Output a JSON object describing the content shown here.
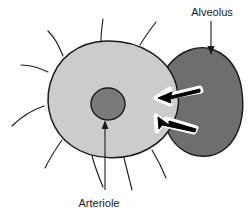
{
  "figure": {
    "type": "anatomical-diagram",
    "background_color": "#ffffff",
    "width": 249,
    "height": 219
  },
  "labels": {
    "alveolus": "Alveolus",
    "arteriole": "Arteriole"
  },
  "colors": {
    "arteriole_fill": "#cccccc",
    "lumen_fill": "#7a7a7a",
    "alveolus_fill": "#6e6e6e",
    "outline": "#1a1a1a",
    "arrow_fill": "#000000",
    "arrow_halo": "#ffffff",
    "text": "#1a1a1a"
  },
  "structures": [
    {
      "name": "arteriole-wall",
      "description": "Large light-gray oval representing the arteriole cross-section",
      "fill": "#cccccc"
    },
    {
      "name": "arteriole-lumen",
      "description": "Small dark-gray circle at the center of the arteriole",
      "fill": "#7a7a7a"
    },
    {
      "name": "alveolus-body",
      "description": "Dark-gray rounded blob to the right, overlapping the arteriole",
      "fill": "#6e6e6e"
    },
    {
      "name": "radiating-fibers",
      "description": "Thin curved lines radiating outward from the arteriole",
      "count": 9
    }
  ],
  "annotations": {
    "alveolus_pointer": {
      "name": "alveolus-leader-arrow",
      "direction": "down",
      "from_label": "Alveolus"
    },
    "arteriole_pointer": {
      "name": "arteriole-leader-arrow",
      "direction": "up",
      "from_label": "Arteriole"
    },
    "exchange_arrows": [
      {
        "name": "gas-exchange-arrow-upper",
        "direction": "left",
        "meaning": "flow from alveolus into arteriole"
      },
      {
        "name": "gas-exchange-arrow-lower",
        "direction": "left",
        "meaning": "flow from alveolus into arteriole"
      }
    ]
  }
}
